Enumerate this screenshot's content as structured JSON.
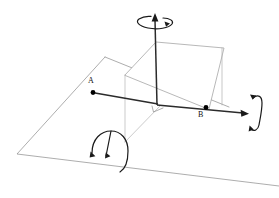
{
  "figure": {
    "background_color": "#ffffff",
    "width": 279,
    "height": 198
  },
  "colors": {
    "outline": "#8a8a8a",
    "axis": "#2b2b2b",
    "arc": "#1a1a1a",
    "point": "#000000",
    "label": "#111111",
    "plane_fill": "#ffffff"
  },
  "labels": {
    "point_a": "A",
    "point_b": "B"
  },
  "points": {
    "a": {
      "label": "A",
      "x": 93,
      "y": 92
    },
    "b": {
      "label": "B",
      "x": 206,
      "y": 107
    },
    "origin": {
      "x": 157,
      "y": 104
    }
  },
  "axes": [
    {
      "name": "vertical-axis",
      "from": [
        157,
        104
      ],
      "to": [
        155,
        17
      ],
      "arrow": "up"
    },
    {
      "name": "right-axis",
      "from": [
        157,
        104
      ],
      "to": [
        247,
        113
      ],
      "arrow": "right"
    },
    {
      "name": "left-axis-segment",
      "from": [
        157,
        104
      ],
      "to": [
        93,
        92
      ],
      "arrow": "none"
    }
  ],
  "rotation_arrows": [
    {
      "name": "yaw-rotation-top",
      "about": "vertical-axis",
      "arrowheads": 2
    },
    {
      "name": "roll-rotation-right",
      "about": "right-axis",
      "arrowheads": 2
    },
    {
      "name": "pitch-rotation-front",
      "about": "depth-axis",
      "arrowheads": 2
    }
  ],
  "planes": {
    "ground": {
      "name": "ground-plane",
      "vertices": [
        [
          105,
          57
        ],
        [
          17,
          154
        ],
        [
          279,
          186
        ],
        [
          229,
          107
        ]
      ]
    },
    "vertical": {
      "name": "vertical-plane",
      "vertices": [
        [
          125,
          75
        ],
        [
          156,
          42
        ],
        [
          224,
          48
        ],
        [
          209,
          109
        ]
      ]
    }
  },
  "markers": {
    "right_angle": {
      "name": "right-angle-marker",
      "x": 157,
      "y": 104
    }
  }
}
